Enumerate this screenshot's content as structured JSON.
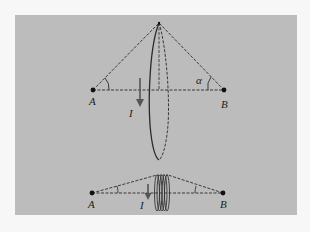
{
  "figure": {
    "background_color": "#f7f7f7",
    "panel_color": "#bcbcbc",
    "line_color": "#2a2a2a",
    "top": {
      "point_a_label": "A",
      "point_b_label": "B",
      "current_label": "I",
      "angle_label": "α",
      "description": "Circular current loop viewed at an angle; points A and B on axis, angle alpha subtended at B"
    },
    "bottom": {
      "point_a_label": "A",
      "point_b_label": "B",
      "current_label": "I",
      "description": "Multi-turn coil (solenoid section) between points A and B with current I"
    }
  }
}
